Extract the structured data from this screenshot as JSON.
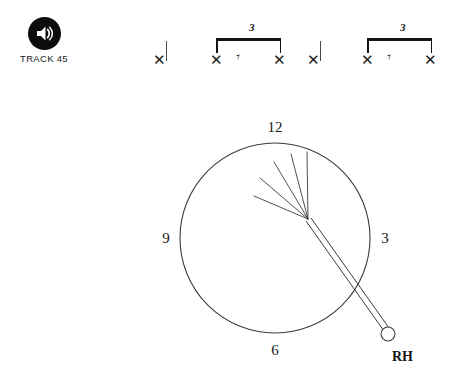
{
  "track": {
    "icon": "speaker-volume-icon",
    "label": "TRACK 45"
  },
  "notation": {
    "notehead_glyph": "✕",
    "rest_glyph": "♯",
    "eighth_rest_glyph": "ᴓE",
    "groups": [
      {
        "type": "single-note",
        "notehead": "✕",
        "has_stem": true
      },
      {
        "type": "triplet",
        "tuplet_number": "3",
        "beats": [
          {
            "kind": "notehead",
            "glyph": "✕"
          },
          {
            "kind": "rest",
            "glyph": "ᴓE"
          },
          {
            "kind": "notehead",
            "glyph": "✕"
          }
        ]
      },
      {
        "type": "single-note",
        "notehead": "✕",
        "has_stem": true
      },
      {
        "type": "triplet",
        "tuplet_number": "3",
        "beats": [
          {
            "kind": "notehead",
            "glyph": "✕"
          },
          {
            "kind": "rest",
            "glyph": "ᴓE"
          },
          {
            "kind": "notehead",
            "glyph": "✕"
          }
        ]
      }
    ]
  },
  "clock": {
    "positions": {
      "top": "12",
      "right": "3",
      "bottom": "6",
      "left": "9"
    },
    "hand_label": "RH",
    "implement": "brush",
    "bristle_count": 5,
    "stroke_color": "#3c3c3c"
  }
}
